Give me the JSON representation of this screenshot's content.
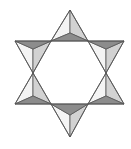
{
  "figure": {
    "colors": {
      "background": "#ffffff",
      "face_white": "#f4f4f4",
      "face_light": "#d2d2d2",
      "face_dark": "#8c8c8c",
      "stroke": "#555555"
    },
    "pyramids": [
      {
        "name": "top",
        "apex": [
          70,
          10
        ],
        "base_left": [
          51,
          41
        ],
        "base_right": [
          88,
          41
        ],
        "center": [
          70,
          33
        ],
        "faces": [
          "white",
          "light",
          "dark"
        ]
      },
      {
        "name": "upper-left",
        "apex": [
          33,
          73
        ],
        "base_left": [
          15,
          41
        ],
        "base_right": [
          51,
          41
        ],
        "center": [
          33,
          49
        ],
        "faces": [
          "white",
          "light",
          "dark"
        ]
      },
      {
        "name": "upper-right",
        "apex": [
          106,
          73
        ],
        "base_left": [
          88,
          41
        ],
        "base_right": [
          124,
          41
        ],
        "center": [
          106,
          49
        ],
        "faces": [
          "white",
          "light",
          "dark"
        ]
      },
      {
        "name": "lower-left",
        "apex": [
          33,
          73
        ],
        "base_left": [
          15,
          104
        ],
        "base_right": [
          51,
          104
        ],
        "center": [
          33,
          96
        ],
        "faces": [
          "white",
          "light",
          "dark"
        ]
      },
      {
        "name": "lower-right",
        "apex": [
          106,
          73
        ],
        "base_left": [
          88,
          104
        ],
        "base_right": [
          124,
          104
        ],
        "center": [
          106,
          96
        ],
        "faces": [
          "white",
          "light",
          "dark"
        ]
      },
      {
        "name": "bottom",
        "apex": [
          70,
          137
        ],
        "base_left": [
          51,
          104
        ],
        "base_right": [
          88,
          104
        ],
        "center": [
          70,
          115
        ],
        "faces": [
          "white",
          "light",
          "dark"
        ]
      }
    ]
  }
}
